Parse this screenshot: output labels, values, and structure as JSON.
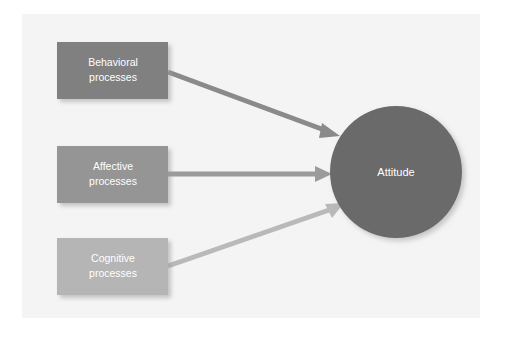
{
  "figure": {
    "canvas": {
      "background_color": "#f4f4f4",
      "page_color": "#ffffff",
      "x": 22,
      "y": 14,
      "width": 458,
      "height": 304
    }
  },
  "nodes": [
    {
      "id": "behavioral",
      "shape": "rectangle",
      "label_line1": "Behavioral",
      "label_line2": "processes",
      "color": "#808080",
      "text_color": "#ffffff",
      "x": 57,
      "y": 42,
      "width": 111,
      "height": 57
    },
    {
      "id": "affective",
      "shape": "rectangle",
      "label_line1": "Affective",
      "label_line2": "processes",
      "color": "#959595",
      "text_color": "#ffffff",
      "x": 57,
      "y": 146,
      "width": 111,
      "height": 57
    },
    {
      "id": "cognitive",
      "shape": "rectangle",
      "label_line1": "Cognitive",
      "label_line2": "processes",
      "color": "#b5b5b5",
      "text_color": "#ffffff",
      "x": 57,
      "y": 238,
      "width": 111,
      "height": 57
    },
    {
      "id": "attitude",
      "shape": "circle",
      "label_line1": "Attitude",
      "label_line2": "",
      "color": "#6b6b6b",
      "text_color": "#ffffff",
      "cx": 396,
      "cy": 172,
      "r": 66
    }
  ],
  "edges": [
    {
      "id": "behavioral-to-attitude",
      "from": "behavioral",
      "to": "attitude",
      "color": "#8a8a8a",
      "direction": "descending",
      "x1": 168,
      "y1": 72,
      "x2": 336,
      "y2": 134
    },
    {
      "id": "affective-to-attitude",
      "from": "affective",
      "to": "attitude",
      "color": "#9b9b9b",
      "direction": "horizontal",
      "x1": 168,
      "y1": 174,
      "x2": 329,
      "y2": 174
    },
    {
      "id": "cognitive-to-attitude",
      "from": "cognitive",
      "to": "attitude",
      "color": "#b9b9b9",
      "direction": "ascending",
      "x1": 168,
      "y1": 266,
      "x2": 340,
      "y2": 205
    }
  ]
}
